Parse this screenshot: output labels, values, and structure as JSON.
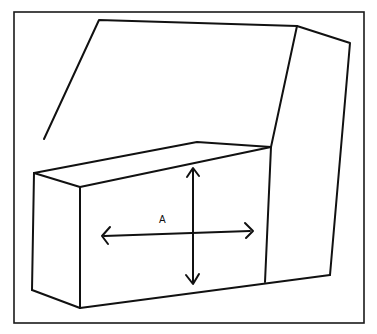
{
  "figure": {
    "label": "A",
    "colors": {
      "line": "#111111",
      "background": "#ffffff"
    },
    "frame": {
      "x": 14,
      "y": 12,
      "width": 350,
      "height": 311
    },
    "arrows": {
      "horizontal": {
        "from": [
          102,
          236
        ],
        "to": [
          252,
          231
        ],
        "heads": "both"
      },
      "vertical": {
        "from": [
          193,
          168
        ],
        "to": [
          193,
          283
        ],
        "heads": "both"
      }
    }
  }
}
